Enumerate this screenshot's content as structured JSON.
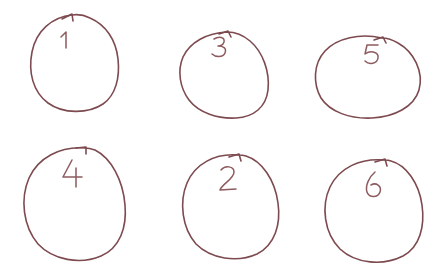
{
  "canvas": {
    "width": 444,
    "height": 272,
    "background_color": "#ffffff",
    "description": "Six hand-drawn circles arranged in two rows of three, each annotated with a handwritten digit near the top inside the circle and a small arrowhead at the top of the stroke."
  },
  "style": {
    "ink_color": "#7d4a4f",
    "ink_color_light": "#8d5a5e",
    "stroke_width": 1.6,
    "digit_stroke_width": 1.5
  },
  "shapes": [
    {
      "id": "circle-1",
      "label": "1",
      "row": 1,
      "column": 1,
      "center_x": 75,
      "center_y": 63,
      "radius_x": 44,
      "radius_y": 49,
      "label_x": 66,
      "label_y": 41,
      "arrow_x": 72,
      "arrow_y": 15
    },
    {
      "id": "circle-3",
      "label": "3",
      "row": 1,
      "column": 2,
      "center_x": 224,
      "center_y": 75,
      "radius_x": 44,
      "radius_y": 44,
      "label_x": 220,
      "label_y": 45,
      "arrow_x": 227,
      "arrow_y": 32
    },
    {
      "id": "circle-5",
      "label": "5",
      "row": 1,
      "column": 3,
      "center_x": 368,
      "center_y": 76,
      "radius_x": 52,
      "radius_y": 43,
      "label_x": 372,
      "label_y": 53,
      "arrow_x": 382,
      "arrow_y": 38
    },
    {
      "id": "circle-4",
      "label": "4",
      "row": 2,
      "column": 1,
      "center_x": 75,
      "center_y": 203,
      "radius_x": 50,
      "radius_y": 60,
      "label_x": 72,
      "label_y": 170,
      "arrow_x": 85,
      "arrow_y": 148
    },
    {
      "id": "circle-2",
      "label": "2",
      "row": 2,
      "column": 2,
      "center_x": 230,
      "center_y": 208,
      "radius_x": 48,
      "radius_y": 53,
      "label_x": 228,
      "label_y": 176,
      "arrow_x": 238,
      "arrow_y": 155
    },
    {
      "id": "circle-6",
      "label": "6",
      "row": 2,
      "column": 3,
      "center_x": 374,
      "center_y": 213,
      "radius_x": 50,
      "radius_y": 52,
      "label_x": 371,
      "label_y": 183,
      "arrow_x": 384,
      "arrow_y": 160
    }
  ],
  "reading_order": [
    "1",
    "3",
    "5",
    "4",
    "2",
    "6"
  ],
  "labels_in_layout_order": {
    "top_row": [
      "1",
      "3",
      "5"
    ],
    "bottom_row": [
      "4",
      "2",
      "6"
    ]
  }
}
